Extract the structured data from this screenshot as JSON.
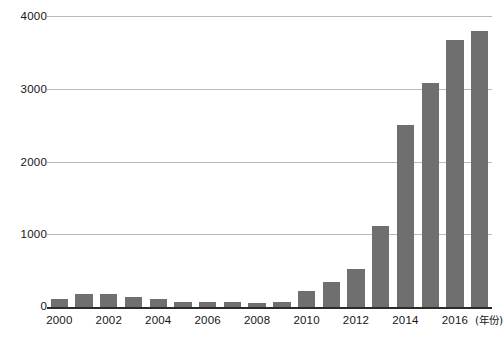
{
  "chart_data": {
    "type": "bar",
    "title": "",
    "subtitle": "",
    "xlabel": "(年份)",
    "ylabel": "",
    "ylim": [
      0,
      4000
    ],
    "grid": true,
    "legend": null,
    "bar_color": "#6f6f6f",
    "gridline_color": "#b9b9b9",
    "axis_color": "#2b2b2b",
    "y_ticks": [
      0,
      1000,
      2000,
      3000,
      4000
    ],
    "y_tick_labels": [
      "0",
      "1000",
      "2000",
      "3000",
      "4000"
    ],
    "x_tick_labels": [
      "2000",
      "2002",
      "2004",
      "2006",
      "2008",
      "2010",
      "2012",
      "2014",
      "2016"
    ],
    "categories": [
      "2000",
      "2001",
      "2002",
      "2003",
      "2004",
      "2005",
      "2006",
      "2007",
      "2008",
      "2009",
      "2010",
      "2011",
      "2012",
      "2013",
      "2014",
      "2015",
      "2016",
      "2017"
    ],
    "values": [
      110,
      180,
      175,
      140,
      110,
      70,
      70,
      70,
      60,
      70,
      215,
      340,
      520,
      1110,
      2500,
      3080,
      3670,
      3790
    ],
    "bars": [
      {
        "category": "2000",
        "value": 110,
        "labeled": true
      },
      {
        "category": "2001",
        "value": 180,
        "labeled": false
      },
      {
        "category": "2002",
        "value": 175,
        "labeled": true
      },
      {
        "category": "2003",
        "value": 140,
        "labeled": false
      },
      {
        "category": "2004",
        "value": 110,
        "labeled": true
      },
      {
        "category": "2005",
        "value": 70,
        "labeled": false
      },
      {
        "category": "2006",
        "value": 70,
        "labeled": true
      },
      {
        "category": "2007",
        "value": 70,
        "labeled": false
      },
      {
        "category": "2008",
        "value": 60,
        "labeled": true
      },
      {
        "category": "2009",
        "value": 70,
        "labeled": false
      },
      {
        "category": "2010",
        "value": 215,
        "labeled": true
      },
      {
        "category": "2011",
        "value": 340,
        "labeled": false
      },
      {
        "category": "2012",
        "value": 520,
        "labeled": true
      },
      {
        "category": "2013",
        "value": 1110,
        "labeled": false
      },
      {
        "category": "2014",
        "value": 2500,
        "labeled": true
      },
      {
        "category": "2015",
        "value": 3080,
        "labeled": false
      },
      {
        "category": "2016",
        "value": 3670,
        "labeled": true
      },
      {
        "category": "2017",
        "value": 3790,
        "labeled": false
      }
    ]
  },
  "axes": {
    "y": {
      "ticks": [
        {
          "label": "4000",
          "value": 4000
        },
        {
          "label": "3000",
          "value": 3000
        },
        {
          "label": "2000",
          "value": 2000
        },
        {
          "label": "1000",
          "value": 1000
        },
        {
          "label": "0",
          "value": 0
        }
      ]
    },
    "x": {
      "ticks": [
        {
          "label": "2000",
          "index": 0
        },
        {
          "label": "2002",
          "index": 2
        },
        {
          "label": "2004",
          "index": 4
        },
        {
          "label": "2006",
          "index": 6
        },
        {
          "label": "2008",
          "index": 8
        },
        {
          "label": "2010",
          "index": 10
        },
        {
          "label": "2012",
          "index": 12
        },
        {
          "label": "2014",
          "index": 14
        },
        {
          "label": "2016",
          "index": 16
        }
      ],
      "unit_label": "(年份)"
    }
  }
}
